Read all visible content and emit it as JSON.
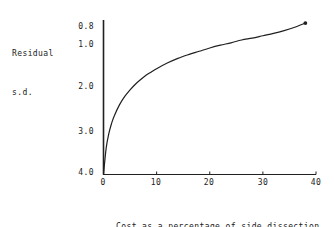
{
  "chart_data": {
    "type": "line",
    "title": "",
    "xlabel": "Cost as a percentage of side dissection cost",
    "xlabel_lines": [
      "Cost as a percentage of side dissection",
      "cost"
    ],
    "ylabel": "Residual s.d.",
    "ylabel_lines": [
      "Residual",
      "s.d."
    ],
    "xlim": [
      0,
      40
    ],
    "ylim": [
      4.0,
      0.7
    ],
    "y_inverted": true,
    "grid": false,
    "legend": null,
    "xticks": [
      0,
      10,
      20,
      30,
      40
    ],
    "xtick_labels": [
      "0",
      "10",
      "20",
      "30",
      "40"
    ],
    "yticks": [
      0.8,
      1.0,
      2.0,
      3.0,
      4.0
    ],
    "ytick_labels": [
      "0.8",
      "1.0",
      "2.0",
      "3.0",
      "4.0"
    ],
    "series": [
      {
        "name": "Residual s.d. vs cost",
        "marker_at_end": true,
        "x": [
          0,
          0.5,
          1,
          1.5,
          2,
          3,
          4,
          5,
          6,
          7,
          8,
          9,
          10,
          12,
          14,
          16,
          18,
          20,
          22,
          24,
          26,
          28,
          30,
          32,
          34,
          36,
          38
        ],
        "y": [
          4.0,
          3.44,
          3.13,
          2.92,
          2.76,
          2.52,
          2.34,
          2.2,
          2.08,
          1.98,
          1.89,
          1.82,
          1.75,
          1.63,
          1.53,
          1.45,
          1.38,
          1.31,
          1.25,
          1.2,
          1.14,
          1.1,
          1.05,
          1.0,
          0.94,
          0.87,
          0.78
        ]
      }
    ]
  },
  "axes": {
    "ytick_top_label": "0.8",
    "ytick_labels": [
      "0.8",
      "1.0",
      "2.0",
      "3.0",
      "4.0"
    ],
    "xtick_labels": [
      "0",
      "10",
      "20",
      "30",
      "40"
    ]
  },
  "colors": {
    "line": "#202020",
    "axis": "#202020",
    "background": "#ffffff",
    "text": "#1a1a1a"
  }
}
